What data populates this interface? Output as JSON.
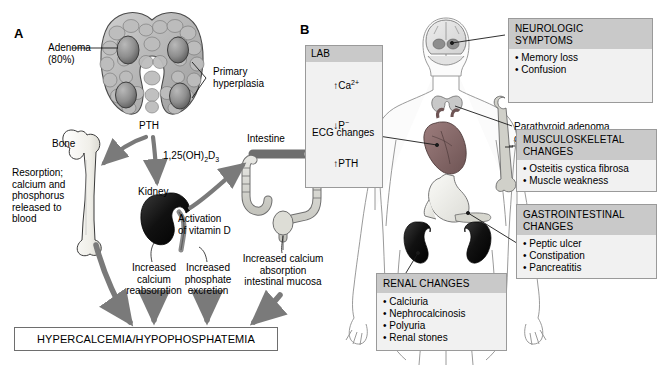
{
  "figure": {
    "panels": [
      {
        "letter": "A"
      },
      {
        "letter": "B"
      }
    ]
  },
  "panel_a": {
    "letter": "A",
    "labels": {
      "adenoma": "Adenoma\n(80%)",
      "primary_hyperplasia": "Primary\nhyperplasia",
      "pth": "PTH",
      "bone": "Bone",
      "resorption": "Resorption;\ncalcium and\nphosphorus\nreleased to\nblood",
      "kidney": "Kidney",
      "intestine": "Intestine",
      "vitamin_d_metabolite": "1,25(OH)2D3",
      "activation_vitamin_d": "Activation\nof vitamin D",
      "increased_calcium_reabsorption": "Increased\ncalcium\nreabsorption",
      "increased_phosphate_excretion": "Increased\nphosphate\nexcretion",
      "increased_calcium_absorption": "Increased calcium\nabsorption\nintestinal mucosa"
    },
    "result_box": "HYPERCALCEMIA/HYPOPHOSPHATEMIA"
  },
  "panel_b": {
    "letter": "B",
    "lab": {
      "title": "LAB",
      "rows": [
        {
          "arrow": "up",
          "analyte": "Ca",
          "sup": "2+"
        },
        {
          "arrow": "down",
          "analyte": "P",
          "sup": "−"
        },
        {
          "arrow": "up",
          "analyte": "PTH",
          "sup": ""
        }
      ]
    },
    "callouts": {
      "ecg_changes": "ECG changes",
      "parathyroid": "Parathyroid adenoma\nor hyperplasia"
    },
    "boxes": [
      {
        "id": "neurologic",
        "title": "NEUROLOGIC\nSYMPTOMS",
        "items": [
          "• Memory loss",
          "• Confusion"
        ]
      },
      {
        "id": "musculoskeletal",
        "title": "MUSCULOSKELETAL\nCHANGES",
        "items": [
          "• Osteitis cystica fibrosa",
          "• Muscle weakness"
        ]
      },
      {
        "id": "gastrointestinal",
        "title": "GASTROINTESTINAL\nCHANGES",
        "items": [
          "• Peptic ulcer",
          "• Constipation",
          "• Pancreatitis"
        ]
      },
      {
        "id": "renal",
        "title": "RENAL CHANGES",
        "items": [
          "• Calciuria",
          "• Nephrocalcinosis",
          "• Polyuria",
          "• Renal stones"
        ]
      }
    ]
  },
  "colors": {
    "box_fill": "#f1f1f1",
    "box_header": "#c9c9c9",
    "box_border": "#9a9a9a",
    "arrow_gray": "#7a7a7a",
    "line_black": "#1a1a1a",
    "organ_dark": "#1a1a1a",
    "heart_red": "#8a6b6b",
    "thyroid_fill": "#b8b8b8",
    "bone_fill": "#f7f7f4"
  }
}
